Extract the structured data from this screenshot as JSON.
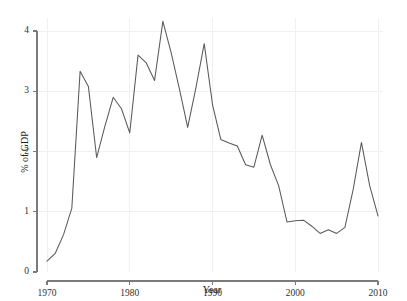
{
  "chart_data": {
    "type": "line",
    "title": "",
    "subtitle": "",
    "xlabel": "Year",
    "ylabel": "% of GDP",
    "xlim": [
      1969,
      2010.6
    ],
    "ylim": [
      0,
      4.22
    ],
    "grid": true,
    "grid_color": "#f0f0f0",
    "legend": "none",
    "line_color": "#5a5a5a",
    "axis_color": "#7a7a7a",
    "xticks": [
      1970,
      1980,
      1990,
      2000,
      2010
    ],
    "xtick_labels": [
      "1970",
      "1980",
      "1990",
      "2000",
      "2010"
    ],
    "yticks": [
      0,
      1,
      2,
      3,
      4
    ],
    "ytick_labels": [
      "0",
      "1",
      "2",
      "3",
      "4"
    ],
    "x": [
      1970,
      1971,
      1972,
      1973,
      1974,
      1975,
      1976,
      1977,
      1978,
      1979,
      1980,
      1981,
      1982,
      1983,
      1984,
      1985,
      1986,
      1987,
      1988,
      1989,
      1990,
      1991,
      1992,
      1993,
      1994,
      1995,
      1996,
      1997,
      1998,
      1999,
      2000,
      2001,
      2002,
      2003,
      2004,
      2005,
      2006,
      2007,
      2008,
      2009,
      2010
    ],
    "values": [
      0.18,
      0.31,
      0.62,
      1.06,
      3.33,
      3.08,
      1.9,
      2.42,
      2.9,
      2.71,
      2.31,
      3.6,
      3.47,
      3.18,
      4.16,
      3.64,
      3.04,
      2.4,
      3.06,
      3.79,
      2.78,
      2.2,
      2.14,
      2.09,
      1.78,
      1.74,
      2.27,
      1.78,
      1.43,
      0.83,
      0.85,
      0.86,
      0.76,
      0.64,
      0.7,
      0.64,
      0.74,
      1.37,
      2.15,
      1.43,
      0.93
    ],
    "series": [
      {
        "name": "% of GDP",
        "values": [
          0.18,
          0.31,
          0.62,
          1.06,
          3.33,
          3.08,
          1.9,
          2.42,
          2.9,
          2.71,
          2.31,
          3.6,
          3.47,
          3.18,
          4.16,
          3.64,
          3.04,
          2.4,
          3.06,
          3.79,
          2.78,
          2.2,
          2.14,
          2.09,
          1.78,
          1.74,
          2.27,
          1.78,
          1.43,
          0.83,
          0.85,
          0.86,
          0.76,
          0.64,
          0.7,
          0.64,
          0.74,
          1.37,
          2.15,
          1.43,
          0.93
        ]
      }
    ]
  }
}
